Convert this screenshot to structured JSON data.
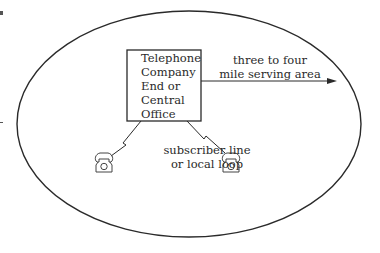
{
  "diagram": {
    "type": "telephone-serving-area",
    "central_office": {
      "lines": [
        "Telephone",
        "Company",
        "End or",
        "Central",
        "Office"
      ]
    },
    "serving_area_label": {
      "line1": "three to four",
      "line2": "mile serving area"
    },
    "loop_label": {
      "line1": "subscriber line",
      "line2": "or local loop"
    },
    "icons": {
      "left_phone": "telephone-icon",
      "right_phone": "telephone-icon"
    },
    "colors": {
      "stroke": "#2a2a2a",
      "background": "#ffffff"
    }
  }
}
